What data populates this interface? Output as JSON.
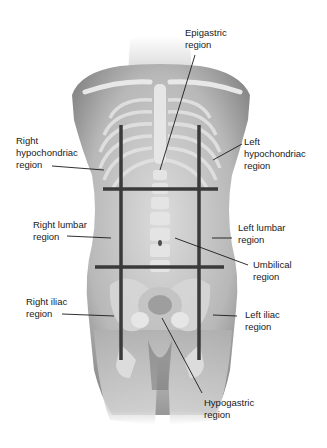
{
  "diagram": {
    "colors": {
      "background": "#ffffff",
      "grid_line": "#3a3a3a",
      "leader_line": "#1a1a1a",
      "text": "#1a1a1a",
      "body_tone": "#c8c8c8"
    },
    "grid": {
      "vertical_lines": [
        {
          "x": 121,
          "y1": 125,
          "y2": 360
        },
        {
          "x": 199,
          "y1": 125,
          "y2": 360
        }
      ],
      "horizontal_lines": [
        {
          "y": 189,
          "x1": 103,
          "x2": 218
        },
        {
          "y": 267,
          "x1": 95,
          "x2": 224
        }
      ]
    },
    "labels": {
      "epigastric": {
        "line1": "Epigastric",
        "line2": "region"
      },
      "right_hypochondriac": {
        "line1": "Right",
        "line2": "hypochondriac",
        "line3": "region"
      },
      "left_hypochondriac": {
        "line1": "Left",
        "line2": "hypochondriac",
        "line3": "region"
      },
      "right_lumbar": {
        "line1": "Right lumbar",
        "line2": "region"
      },
      "left_lumbar": {
        "line1": "Left lumbar",
        "line2": "region"
      },
      "umbilical": {
        "line1": "Umbilical",
        "line2": "region"
      },
      "right_iliac": {
        "line1": "Right iliac",
        "line2": "region"
      },
      "left_iliac": {
        "line1": "Left iliac",
        "line2": "region"
      },
      "hypogastric": {
        "line1": "Hypogastric",
        "line2": "region"
      }
    }
  }
}
